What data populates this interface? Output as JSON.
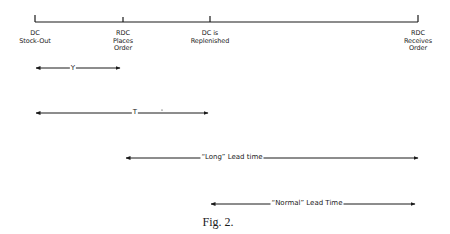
{
  "timeline": {
    "events": [
      {
        "label": "DC\nStock-Out"
      },
      {
        "label": "RDC\nPlaces\nOrder"
      },
      {
        "label": "DC is\nReplenished"
      },
      {
        "label": "RDC\nReceives\nOrder"
      }
    ]
  },
  "intervals": [
    {
      "label": "Y",
      "from": "DC Stock-Out",
      "to": "RDC Places Order"
    },
    {
      "label": "T",
      "from": "DC Stock-Out",
      "to": "DC is Replenished"
    },
    {
      "label": "“Long” Lead time",
      "from": "RDC Places Order",
      "to": "RDC Receives Order"
    },
    {
      "label": "“Normal” Lead Time",
      "from": "DC is Replenished",
      "to": "RDC Receives Order"
    }
  ],
  "caption": "Fig. 2.",
  "colors": {
    "line": "#1a1a1a",
    "background": "#ffffff"
  }
}
